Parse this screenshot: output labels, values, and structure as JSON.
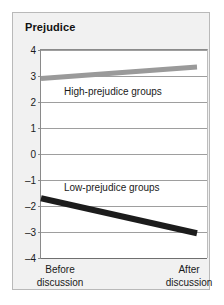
{
  "chart_data": {
    "type": "line",
    "title": "Prejudice",
    "xlabel": "",
    "ylabel": "Prejudice",
    "ylim": [
      -4,
      4
    ],
    "yticks": [
      4,
      3,
      2,
      1,
      0,
      -1,
      -2,
      -3,
      -4
    ],
    "ytick_labels": [
      "4",
      "3",
      "2",
      "1",
      "0",
      "–1",
      "–2",
      "–3",
      "–4"
    ],
    "grid": true,
    "legend": "inline-labels",
    "categories": [
      "Before discussion",
      "After discussion"
    ],
    "xtick_labels": [
      {
        "line1": "Before",
        "line2": "discussion"
      },
      {
        "line1": "After",
        "line2": "discussion"
      }
    ],
    "series": [
      {
        "name": "High-prejudice groups",
        "label": "High-prejudice groups",
        "color": "#9a9a9a",
        "values": [
          2.9,
          3.35
        ]
      },
      {
        "name": "Low-prejudice groups",
        "label": "Low-prejudice groups",
        "color": "#1c1c1c",
        "values": [
          -1.7,
          -3.05
        ]
      }
    ]
  },
  "colors": {
    "card_background": "#f1f1f1",
    "card_border": "#b9b9b9",
    "plot_background": "#ffffff",
    "gridline": "#9e9e9e",
    "axis": "#8a8a8a",
    "text": "#1a1a1a",
    "high_series": "#9a9a9a",
    "low_series": "#1c1c1c"
  }
}
